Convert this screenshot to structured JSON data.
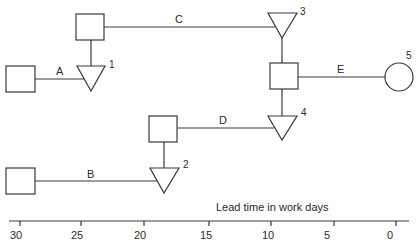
{
  "diagram": {
    "title": "",
    "axis": {
      "label": "Lead time in work days",
      "ticks": [
        "30",
        "25",
        "20",
        "15",
        "10",
        "5",
        "0"
      ]
    },
    "activities": [
      {
        "id": "A",
        "label": "A"
      },
      {
        "id": "B",
        "label": "B"
      },
      {
        "id": "C",
        "label": "C"
      },
      {
        "id": "D",
        "label": "D"
      },
      {
        "id": "E",
        "label": "E"
      }
    ],
    "nodes": [
      {
        "id": "1",
        "label": "1",
        "shape": "triangle"
      },
      {
        "id": "2",
        "label": "2",
        "shape": "triangle"
      },
      {
        "id": "3",
        "label": "3",
        "shape": "triangle"
      },
      {
        "id": "4",
        "label": "4",
        "shape": "triangle"
      },
      {
        "id": "5",
        "label": "5",
        "shape": "circle"
      }
    ],
    "colors": {
      "stroke": "#3a3a3a",
      "background": "#ffffff",
      "text": "#2a2a2a"
    }
  }
}
